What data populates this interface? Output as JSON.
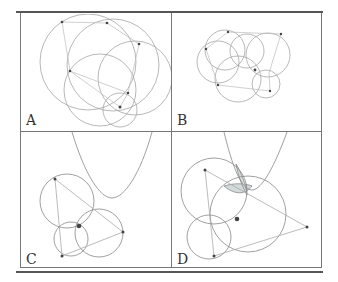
{
  "figure": {
    "panels": [
      {
        "id": "A",
        "label": "A"
      },
      {
        "id": "B",
        "label": "B"
      },
      {
        "id": "C",
        "label": "C"
      },
      {
        "id": "D",
        "label": "D"
      }
    ],
    "colors": {
      "line": "#8a8a8a",
      "point": "#444444",
      "shade": "#d0d8d8",
      "border": "#777777"
    }
  }
}
